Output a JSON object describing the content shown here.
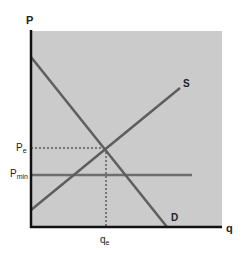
{
  "diagram": {
    "axes": {
      "y_label": "P",
      "x_label": "q"
    },
    "curves": [
      {
        "id": "supply",
        "label": "S",
        "type": "upward-sloping"
      },
      {
        "id": "demand",
        "label": "D",
        "type": "downward-sloping"
      }
    ],
    "price_labels": {
      "equilibrium": {
        "main": "P",
        "sub": "e"
      },
      "minimum": {
        "main": "P",
        "sub": "min"
      }
    },
    "quantity_labels": {
      "equilibrium": {
        "main": "q",
        "sub": "e"
      }
    },
    "colors": {
      "plot_background": "#c9c9c9",
      "axis": "#111111",
      "curve": "#666666",
      "pmin_line": "#6e6e6e",
      "dashed": "#222222"
    }
  }
}
